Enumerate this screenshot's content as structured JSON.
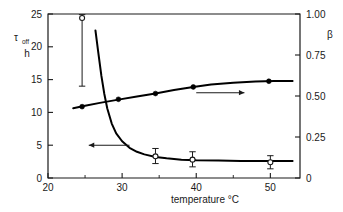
{
  "chart_data": {
    "type": "line",
    "title": "",
    "xlabel": "temperature °C",
    "xlabel_text": "temperature",
    "xunit": "°C",
    "x_ticks": [
      20,
      30,
      40,
      50
    ],
    "x_tick_labels": [
      "20",
      "30",
      "40",
      "50"
    ],
    "x_minor_ticks": [
      25,
      35,
      45
    ],
    "xlim": [
      20,
      54
    ],
    "grid": false,
    "legend_position": "none",
    "left_axis": {
      "label_main": "τ",
      "label_sub": "off",
      "label_unit": "h",
      "ticks": [
        0,
        5,
        10,
        15,
        20,
        25
      ],
      "tick_labels": [
        "0",
        "5",
        "10",
        "15",
        "20",
        "25"
      ],
      "ylim": [
        0,
        25
      ]
    },
    "right_axis": {
      "label": "β",
      "ticks": [
        0,
        0.25,
        0.5,
        0.75,
        1.0
      ],
      "tick_labels": [
        "0",
        "0.25",
        "0.50",
        "0.75",
        "1.00"
      ],
      "ylim": [
        0,
        1.0
      ]
    },
    "series": [
      {
        "name": "tau_off",
        "axis": "left",
        "marker": "open-circle",
        "x": [
          24.6,
          34.5,
          39.5,
          50.0
        ],
        "values": [
          24.4,
          3.3,
          2.8,
          2.4
        ],
        "yerr_low": [
          10.4,
          1.1,
          1.1,
          1.0
        ],
        "yerr_high": [
          0.5,
          1.2,
          1.2,
          1.0
        ],
        "curve_x": [
          26.4,
          26.8,
          27.2,
          27.6,
          28.0,
          28.6,
          29.2,
          30.0,
          31.0,
          32.0,
          33.0,
          34.5,
          36.0,
          38.0,
          40.0,
          43.0,
          46.0,
          50.0,
          53.0
        ],
        "curve_y": [
          22.5,
          19.0,
          15.6,
          12.8,
          10.6,
          8.3,
          6.8,
          5.6,
          4.6,
          4.0,
          3.6,
          3.2,
          3.0,
          2.8,
          2.7,
          2.65,
          2.6,
          2.6,
          2.6
        ]
      },
      {
        "name": "beta",
        "axis": "right",
        "marker": "filled-circle",
        "x": [
          24.6,
          29.5,
          34.5,
          39.6,
          49.8
        ],
        "values": [
          0.435,
          0.48,
          0.515,
          0.555,
          0.59
        ],
        "curve_x": [
          23.4,
          25.0,
          27.0,
          29.5,
          32.0,
          34.5,
          37.0,
          39.6,
          42.0,
          45.0,
          48.0,
          50.5,
          53.0
        ],
        "curve_y": [
          0.425,
          0.44,
          0.458,
          0.478,
          0.497,
          0.515,
          0.536,
          0.555,
          0.57,
          0.581,
          0.588,
          0.591,
          0.592
        ]
      }
    ],
    "annotations": [
      {
        "name": "left-arrow-annotation",
        "direction": "left",
        "x_from": 31.0,
        "x_to": 25.5,
        "y": 5.0,
        "axis": "left"
      },
      {
        "name": "right-arrow-annotation",
        "direction": "right",
        "x_from": 40.0,
        "x_to": 46.5,
        "y": 0.52,
        "axis": "right"
      }
    ]
  }
}
